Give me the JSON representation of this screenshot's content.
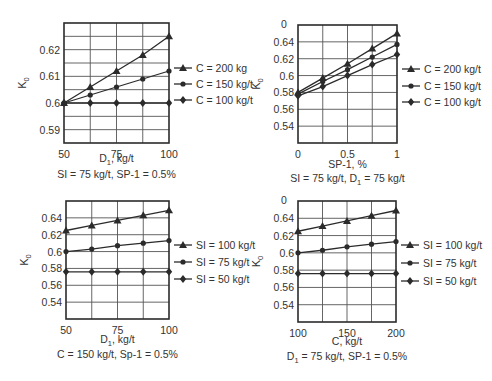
{
  "chart_data": [
    {
      "type": "line",
      "id": "p1",
      "title": "",
      "xlabel": "D1, kg/t",
      "xlabel_main": "D",
      "xlabel_sub": "1",
      "xlabel_rest": ", kg/t",
      "caption": "SI = 75 kg/t, SP-1 = 0.5%",
      "ylabel": "K0",
      "x": [
        50,
        62.5,
        75,
        87.5,
        100
      ],
      "xticks": [
        50,
        75,
        100
      ],
      "yticks": [
        0.59,
        0.6,
        0.61,
        0.62
      ],
      "ytick_labels": [
        "0.59",
        "0.6",
        "0.61",
        "0.62"
      ],
      "xlim": [
        50,
        100
      ],
      "ylim": [
        0.585,
        0.63
      ],
      "grid": true,
      "xgrid_step": 12.5,
      "ygrid_step": 0.005,
      "legend_position": "right",
      "series": [
        {
          "name": "C = 200 kg",
          "marker": "triangle",
          "values": [
            0.6,
            0.606,
            0.612,
            0.618,
            0.625
          ]
        },
        {
          "name": "C = 150 kg/t",
          "marker": "circle",
          "values": [
            0.6,
            0.603,
            0.606,
            0.609,
            0.612
          ]
        },
        {
          "name": "C = 100 kg/t",
          "marker": "diamond",
          "values": [
            0.6,
            0.6,
            0.6,
            0.6,
            0.6
          ]
        }
      ]
    },
    {
      "type": "line",
      "id": "p2",
      "title": "",
      "xlabel": "SP-1, %",
      "caption": "SI = 75 kg/t, D1 = 75 kg/t",
      "caption_pre": "SI = 75 kg/t, D",
      "caption_sub": "1",
      "caption_post": " = 75 kg/t",
      "ylabel": "K0",
      "x": [
        0,
        0.25,
        0.5,
        0.75,
        1
      ],
      "xticks": [
        0,
        0.5,
        1
      ],
      "yticks": [
        0.54,
        0.56,
        0.58,
        0.6,
        0.62,
        0.64
      ],
      "ytick_labels": [
        "0.54",
        "0.56",
        "0.58",
        "0.6",
        "0.62",
        "0.64"
      ],
      "top_partial_label": "0",
      "xlim": [
        0,
        1
      ],
      "ylim": [
        0.52,
        0.66
      ],
      "grid": true,
      "xgrid_step": 0.25,
      "ygrid_step": 0.02,
      "legend_position": "right",
      "series": [
        {
          "name": "C = 200 kg/t",
          "marker": "triangle",
          "values": [
            0.58,
            0.597,
            0.614,
            0.632,
            0.65
          ]
        },
        {
          "name": "C = 150 kg/t",
          "marker": "circle",
          "values": [
            0.578,
            0.593,
            0.607,
            0.622,
            0.637
          ]
        },
        {
          "name": "C = 100 kg/t",
          "marker": "diamond",
          "values": [
            0.576,
            0.587,
            0.6,
            0.613,
            0.625
          ]
        }
      ]
    },
    {
      "type": "line",
      "id": "p3",
      "title": "",
      "xlabel": "D1, kg/t",
      "xlabel_main": "D",
      "xlabel_sub": "1",
      "xlabel_rest": ", kg/t",
      "caption": "C = 150 kg/t, Sp-1 = 0.5%",
      "ylabel": "K0",
      "x": [
        50,
        62.5,
        75,
        87.5,
        100
      ],
      "xticks": [
        50,
        75,
        100
      ],
      "yticks": [
        0.54,
        0.56,
        0.58,
        0.6,
        0.62,
        0.64
      ],
      "ytick_labels": [
        "0.54",
        "0.56",
        "0.58",
        "0.6",
        "0.62",
        "0.64"
      ],
      "xlim": [
        50,
        100
      ],
      "ylim": [
        0.52,
        0.66
      ],
      "grid": true,
      "xgrid_step": 12.5,
      "ygrid_step": 0.02,
      "legend_position": "right",
      "series": [
        {
          "name": "SI = 100 kg/t",
          "marker": "triangle",
          "values": [
            0.625,
            0.631,
            0.637,
            0.643,
            0.649
          ]
        },
        {
          "name": "SI = 75 kg/t",
          "marker": "circle",
          "values": [
            0.6,
            0.603,
            0.607,
            0.61,
            0.613
          ]
        },
        {
          "name": "SI = 50 kg/t",
          "marker": "diamond",
          "values": [
            0.576,
            0.576,
            0.576,
            0.576,
            0.576
          ]
        }
      ]
    },
    {
      "type": "line",
      "id": "p4",
      "title": "",
      "xlabel": "C, kg/t",
      "caption": "D1 = 75 kg/t, SP-1 = 0.5%",
      "caption_pre": "D",
      "caption_sub": "1",
      "caption_post": " = 75 kg/t, SP-1 = 0.5%",
      "ylabel": "K0",
      "x": [
        100,
        125,
        150,
        175,
        200
      ],
      "xticks": [
        100,
        150,
        200
      ],
      "yticks": [
        0.54,
        0.56,
        0.58,
        0.6,
        0.62,
        0.64
      ],
      "ytick_labels": [
        "0.54",
        "0.56",
        "0.58",
        "0.6",
        "0.62",
        "0.64"
      ],
      "top_partial_label": "0",
      "xlim": [
        100,
        200
      ],
      "ylim": [
        0.52,
        0.66
      ],
      "grid": true,
      "xgrid_step": 25,
      "ygrid_step": 0.02,
      "legend_position": "right",
      "series": [
        {
          "name": "SI = 100 kg/t",
          "marker": "triangle",
          "values": [
            0.625,
            0.631,
            0.637,
            0.643,
            0.649
          ]
        },
        {
          "name": "SI = 75 kg/t",
          "marker": "circle",
          "values": [
            0.6,
            0.603,
            0.607,
            0.61,
            0.613
          ]
        },
        {
          "name": "SI = 50 kg/t",
          "marker": "diamond",
          "values": [
            0.576,
            0.576,
            0.576,
            0.576,
            0.576
          ]
        }
      ]
    }
  ],
  "layout": {
    "frames": [
      {
        "left": 64,
        "top": 23,
        "right": 169,
        "bottom": 143,
        "legend_x": 174,
        "legend_y": [
          68,
          84,
          100
        ],
        "xlabel_y": 162,
        "caption_y": 178
      },
      {
        "left": 298,
        "top": 25,
        "right": 397,
        "bottom": 143,
        "legend_x": 402,
        "legend_y": [
          69,
          86,
          102
        ],
        "xlabel_y": 168,
        "caption_y": 182
      },
      {
        "left": 66,
        "top": 201,
        "right": 169,
        "bottom": 319,
        "legend_x": 174,
        "legend_y": [
          245,
          262,
          279
        ],
        "xlabel_y": 343,
        "caption_y": 358
      },
      {
        "left": 298,
        "top": 201,
        "right": 396,
        "bottom": 322,
        "legend_x": 401,
        "legend_y": [
          245,
          263,
          281
        ],
        "xlabel_y": 345,
        "caption_y": 360
      }
    ],
    "colors": {
      "line": "#2b2b2b",
      "grid": "#555555",
      "frame": "#2b2b2b"
    }
  }
}
